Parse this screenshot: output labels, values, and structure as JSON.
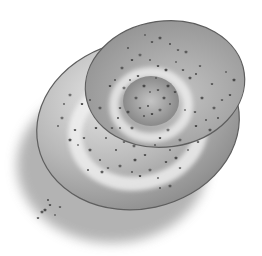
{
  "image": {
    "subject": "Poppy seed bun illustration",
    "style": "grayscale watercolor",
    "width": 262,
    "height": 256
  },
  "colors": {
    "background": "#ffffff",
    "shadow": "#9a9a9a",
    "bun_outer_light": "#e6e6e6",
    "bun_outer_mid": "#b8b8b8",
    "bun_outer_dark": "#8a8a8a",
    "top_lobe_light": "#c4c4c4",
    "top_lobe_dark": "#8f8f8f",
    "center_dark": "#7e7e7e",
    "highlight": "#f2f2f2",
    "edge_line": "#5e5e5e",
    "seed": "#3f3f3f"
  },
  "shapes": {
    "shadow": {
      "cx": 112,
      "cy": 165,
      "rx": 95,
      "ry": 78
    },
    "outer_ring": {
      "cx": 138,
      "cy": 125,
      "rx": 102,
      "ry": 84,
      "rotate": -12
    },
    "top_lobe": {
      "cx": 165,
      "cy": 84,
      "rx": 80,
      "ry": 63,
      "rotate": -8
    },
    "inner_hole": {
      "cx": 151,
      "cy": 101,
      "rx": 28,
      "ry": 25
    }
  },
  "seeds": [
    [
      145,
      35
    ],
    [
      152,
      42
    ],
    [
      160,
      38
    ],
    [
      170,
      44
    ],
    [
      178,
      50
    ],
    [
      186,
      52
    ],
    [
      128,
      48
    ],
    [
      132,
      60
    ],
    [
      140,
      55
    ],
    [
      150,
      60
    ],
    [
      158,
      66
    ],
    [
      166,
      70
    ],
    [
      176,
      62
    ],
    [
      183,
      70
    ],
    [
      190,
      78
    ],
    [
      196,
      74
    ],
    [
      200,
      66
    ],
    [
      122,
      68
    ],
    [
      115,
      80
    ],
    [
      110,
      86
    ],
    [
      124,
      88
    ],
    [
      130,
      80
    ],
    [
      138,
      76
    ],
    [
      144,
      86
    ],
    [
      150,
      92
    ],
    [
      158,
      90
    ],
    [
      164,
      98
    ],
    [
      148,
      106
    ],
    [
      140,
      108
    ],
    [
      136,
      98
    ],
    [
      144,
      116
    ],
    [
      152,
      114
    ],
    [
      160,
      110
    ],
    [
      170,
      104
    ],
    [
      175,
      92
    ],
    [
      168,
      86
    ],
    [
      156,
      78
    ],
    [
      120,
      108
    ],
    [
      128,
      112
    ],
    [
      118,
      118
    ],
    [
      112,
      128
    ],
    [
      100,
      108
    ],
    [
      90,
      100
    ],
    [
      82,
      104
    ],
    [
      70,
      95
    ],
    [
      64,
      104
    ],
    [
      75,
      130
    ],
    [
      70,
      140
    ],
    [
      78,
      145
    ],
    [
      84,
      138
    ],
    [
      90,
      150
    ],
    [
      100,
      160
    ],
    [
      108,
      168
    ],
    [
      120,
      166
    ],
    [
      132,
      172
    ],
    [
      140,
      176
    ],
    [
      150,
      170
    ],
    [
      158,
      178
    ],
    [
      166,
      162
    ],
    [
      176,
      158
    ],
    [
      188,
      150
    ],
    [
      198,
      142
    ],
    [
      210,
      130
    ],
    [
      218,
      118
    ],
    [
      222,
      100
    ],
    [
      214,
      108
    ],
    [
      206,
      120
    ],
    [
      196,
      126
    ],
    [
      180,
      140
    ],
    [
      170,
      150
    ],
    [
      230,
      95
    ],
    [
      234,
      80
    ],
    [
      226,
      72
    ],
    [
      212,
      84
    ],
    [
      202,
      98
    ],
    [
      116,
      150
    ],
    [
      124,
      142
    ],
    [
      134,
      146
    ],
    [
      106,
      138
    ],
    [
      96,
      128
    ],
    [
      62,
      118
    ],
    [
      58,
      126
    ],
    [
      50,
      205
    ],
    [
      45,
      210
    ],
    [
      55,
      215
    ],
    [
      38,
      218
    ],
    [
      42,
      212
    ],
    [
      48,
      200
    ],
    [
      60,
      207
    ],
    [
      132,
      128
    ],
    [
      120,
      128
    ],
    [
      160,
      138
    ],
    [
      168,
      130
    ],
    [
      155,
      145
    ],
    [
      145,
      155
    ],
    [
      135,
      160
    ],
    [
      185,
      110
    ],
    [
      195,
      112
    ],
    [
      102,
      172
    ],
    [
      88,
      170
    ],
    [
      180,
      168
    ],
    [
      170,
      186
    ],
    [
      160,
      188
    ]
  ]
}
